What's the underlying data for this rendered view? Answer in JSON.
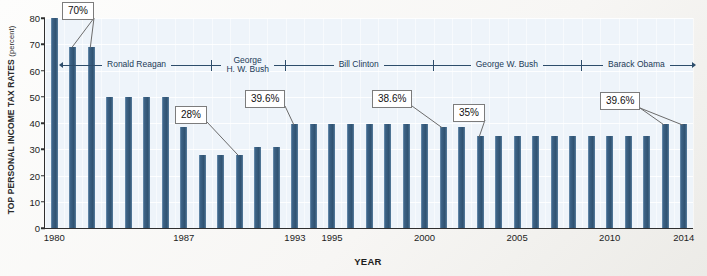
{
  "chart_data": {
    "type": "bar",
    "title": "",
    "xlabel": "YEAR",
    "ylabel": "TOP PERSONAL INCOME TAX RATES",
    "ylabel_unit": "(percent)",
    "ylim": [
      0,
      80
    ],
    "ytick_step": 10,
    "yticks": [
      "0",
      "10",
      "20",
      "30",
      "40",
      "50",
      "60",
      "70",
      "80"
    ],
    "grid": true,
    "legend": "none",
    "bar_color": "#3c6285",
    "plot_background": "#eef4fa",
    "x": [
      1980,
      1981,
      1982,
      1983,
      1984,
      1985,
      1986,
      1987,
      1988,
      1989,
      1990,
      1991,
      1992,
      1993,
      1994,
      1995,
      1996,
      1997,
      1998,
      1999,
      2000,
      2001,
      2002,
      2003,
      2004,
      2005,
      2006,
      2007,
      2008,
      2009,
      2010,
      2011,
      2012,
      2013,
      2014
    ],
    "values": [
      80,
      69.1,
      69.1,
      50,
      50,
      50,
      50,
      38.5,
      28,
      28,
      28,
      31,
      31,
      39.6,
      39.6,
      39.6,
      39.6,
      39.6,
      39.6,
      39.6,
      39.6,
      38.6,
      38.6,
      35,
      35,
      35,
      35,
      35,
      35,
      35,
      35,
      35,
      35,
      39.6,
      39.6
    ],
    "xtick_labels": [
      "1980",
      "1987",
      "1993",
      "1995",
      "2000",
      "2005",
      "2010",
      "2014"
    ],
    "xtick_years": [
      1980,
      1987,
      1993,
      1995,
      2000,
      2005,
      2010,
      2014
    ],
    "annotations": [
      {
        "text": "70%",
        "value": 69.1,
        "points_to_years": [
          1981,
          1982
        ]
      },
      {
        "text": "28%",
        "value": 28,
        "points_to_years": [
          1990
        ]
      },
      {
        "text": "39.6%",
        "value": 39.6,
        "points_to_years": [
          1993
        ]
      },
      {
        "text": "38.6%",
        "value": 38.6,
        "points_to_years": [
          2001
        ]
      },
      {
        "text": "35%",
        "value": 35,
        "points_to_years": [
          2003
        ]
      },
      {
        "text": "39.6%",
        "value": 39.6,
        "points_to_years": [
          2013,
          2014
        ]
      }
    ],
    "presidents": [
      {
        "name": "Ronald Reagan",
        "start_year": 1981,
        "end_year": 1988
      },
      {
        "name": "George\nH. W. Bush",
        "start_year": 1989,
        "end_year": 1992
      },
      {
        "name": "Bill Clinton",
        "start_year": 1993,
        "end_year": 2000
      },
      {
        "name": "George W. Bush",
        "start_year": 2001,
        "end_year": 2008
      },
      {
        "name": "Barack Obama",
        "start_year": 2009,
        "end_year": 2014
      }
    ]
  }
}
